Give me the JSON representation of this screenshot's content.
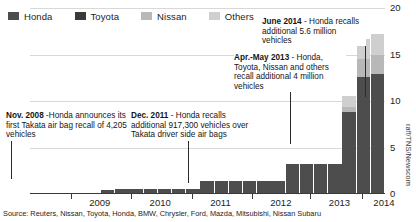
{
  "legend": {
    "items": [
      {
        "label": "Honda",
        "color": "#4d4d4d"
      },
      {
        "label": "Toyota",
        "color": "#3a3a3a"
      },
      {
        "label": "Nissan",
        "color": "#b8b8b8"
      },
      {
        "label": "Others",
        "color": "#cfcfcf"
      }
    ]
  },
  "annotations": [
    {
      "name": "annotation-nov-2008",
      "date": "Nov. 2008",
      "text": " -Honda announces its first Takata air bag recall of 4,205 vehicles",
      "full": "Nov. 2008 -Honda announces its first Takata air bag recall of 4,205 vehicles"
    },
    {
      "name": "annotation-dec-2011",
      "date": "Dec. 2011",
      "text": " - Honda recalls additional 917,300 vehicles over Takata driver side air bags",
      "full": "Dec. 2011 - Honda recalls additional 917,300 vehicles over Takata driver side air bags"
    },
    {
      "name": "annotation-apr-may-2013",
      "date": "Apr.-May 2013",
      "text": " - Honda, Toyota, Nissan and others recall additional 4 million vehicles",
      "full": "Apr.-May 2013 - Honda, Toyota, Nissan and others recall additional 4 million vehicles"
    },
    {
      "name": "annotation-june-2014",
      "date": "June 2014",
      "text": " - Honda recalls additional 5.6 million vehicles",
      "full": "June 2014 - Honda recalls additional 5.6 million vehicles"
    }
  ],
  "source_note": "Source: Reuters, Nissan, Toyota, Honda, BMW, Chrysler, Ford, Mazda, Mitsubishi, Nissan Subaru",
  "credit": "raff/TNS/Newscom",
  "chart_data": {
    "type": "bar",
    "title": "",
    "subtitle": "",
    "xlabel": "",
    "ylabel": "",
    "ylim": [
      0,
      20
    ],
    "yticks": [
      0,
      5,
      10,
      15,
      20
    ],
    "grid": true,
    "legend_position": "top-left",
    "stacked": true,
    "note": "Cumulative Takata air bag recalls, millions of vehicles",
    "xtick_labels": [
      "2009",
      "2010",
      "2011",
      "2012",
      "2013",
      "2014"
    ],
    "xtick_positions": [
      0.115,
      0.285,
      0.455,
      0.625,
      0.79,
      0.935
    ],
    "categories": [
      "2008-Q4",
      "2009-Q1",
      "2009-Q2",
      "2009-Q3",
      "2009-Q4",
      "2010-Q1",
      "2010-Q2",
      "2010-Q3",
      "2010-Q4",
      "2011-Q1",
      "2011-Q2",
      "2011-Q3",
      "2011-Q4",
      "2012-Q1",
      "2012-Q2",
      "2012-Q3",
      "2012-Q4",
      "2013-Q1",
      "2013-Q2",
      "2013-Q3",
      "2013-Q4",
      "2014-Q1",
      "2014-Q2",
      "2014-Q3",
      "2014-Q4"
    ],
    "series": [
      {
        "name": "Honda",
        "color": "#4d4d4d",
        "values": [
          0.0,
          0.0,
          0.1,
          0.1,
          0.1,
          0.4,
          0.5,
          0.5,
          0.5,
          0.5,
          0.5,
          0.5,
          1.4,
          1.4,
          1.4,
          1.4,
          1.4,
          1.4,
          3.2,
          3.2,
          3.2,
          3.2,
          8.8,
          12.6,
          12.9
        ]
      },
      {
        "name": "Toyota",
        "color": "#3a3a3a",
        "values": [
          0.0,
          0.0,
          0.0,
          0.0,
          0.0,
          0.0,
          0.0,
          0.0,
          0.0,
          0.0,
          0.0,
          0.0,
          0.0,
          0.0,
          0.0,
          0.0,
          0.0,
          0.0,
          0.0,
          0.0,
          0.0,
          0.0,
          0.0,
          0.0,
          0.0
        ]
      },
      {
        "name": "Nissan",
        "color": "#b8b8b8",
        "values": [
          0.0,
          0.0,
          0.0,
          0.0,
          0.0,
          0.0,
          0.0,
          0.0,
          0.0,
          0.0,
          0.0,
          0.0,
          0.0,
          0.0,
          0.0,
          0.0,
          0.0,
          0.0,
          0.0,
          0.0,
          0.0,
          0.0,
          0.6,
          1.9,
          2.0
        ]
      },
      {
        "name": "Others",
        "color": "#cfcfcf",
        "values": [
          0.0,
          0.0,
          0.0,
          0.0,
          0.0,
          0.0,
          0.0,
          0.0,
          0.0,
          0.0,
          0.0,
          0.0,
          0.0,
          0.0,
          0.0,
          0.0,
          0.0,
          0.0,
          0.0,
          0.0,
          0.0,
          0.0,
          1.1,
          2.2,
          2.3
        ]
      }
    ]
  }
}
